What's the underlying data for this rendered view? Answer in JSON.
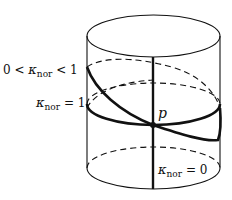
{
  "figure": {
    "labels": {
      "tilted": {
        "left": "0 < ",
        "kappa": "κ",
        "sub": "nor",
        "right": " < 1"
      },
      "horizontal": {
        "kappa": "κ",
        "sub": "nor",
        "right": " = 1"
      },
      "vertical": {
        "kappa": "κ",
        "sub": "nor",
        "right": " = 0"
      },
      "point": "p"
    },
    "colors": {
      "stroke": "#111111",
      "background": "#ffffff"
    }
  }
}
